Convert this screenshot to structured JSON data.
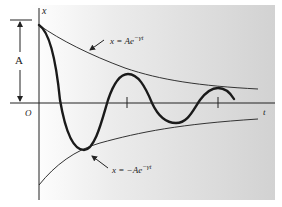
{
  "figure": {
    "type": "damped-oscillation-diagram",
    "labels": {
      "x_axis": "x",
      "t_axis": "t",
      "origin": "O",
      "amplitude": "A",
      "upper_envelope": "x = Ae",
      "upper_envelope_exp": "−γt",
      "lower_envelope": "x = −Ae",
      "lower_envelope_exp": "−γt"
    },
    "colors": {
      "panel_left": "#ffffff",
      "panel_right": "#d2d2d2",
      "curve": "#1a1a1a",
      "envelope": "#333333",
      "axis": "#222222"
    }
  }
}
